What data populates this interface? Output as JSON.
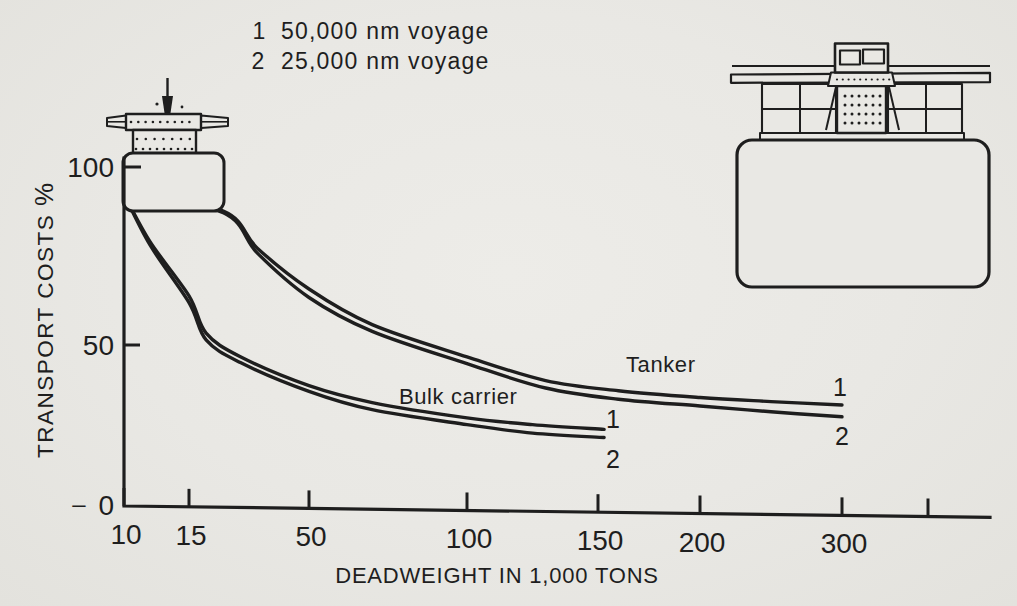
{
  "style": {
    "paper": "#e9e8e4",
    "ink": "#1e1e1e"
  },
  "legend": {
    "items": [
      {
        "marker": "1",
        "label": "50,000 nm voyage"
      },
      {
        "marker": "2",
        "label": "25,000 nm voyage"
      }
    ]
  },
  "y_axis": {
    "title": "TRANSPORT COSTS",
    "unit": "%",
    "zero_prefix": "–",
    "tick_labels": [
      "100",
      "50",
      "0"
    ]
  },
  "x_axis": {
    "title": "DEADWEIGHT IN 1,000 TONS",
    "tick_labels": [
      "10",
      "15",
      "50",
      "100",
      "150",
      "200",
      "300",
      ""
    ]
  },
  "curve_labels": {
    "tanker": "Tanker",
    "bulk": "Bulk carrier",
    "tanker_end_1": "1",
    "tanker_end_2": "2",
    "bulk_end_1": "1",
    "bulk_end_2": "2"
  },
  "illustrations": {
    "small_ship": "small-ship-illustration",
    "large_ship": "large-ship-illustration"
  },
  "chart_data": {
    "type": "line",
    "title": "",
    "xlabel": "DEADWEIGHT IN 1,000 TONS",
    "ylabel": "TRANSPORT COSTS %",
    "x_unit": "1,000 tons deadweight",
    "y_unit": "percent of reference transport cost",
    "xlim": [
      10,
      360
    ],
    "ylim": [
      0,
      110
    ],
    "x_scale_note": "hand-drawn non-linear axis; tick positions compressed toward right",
    "x_ticks": [
      10,
      15,
      50,
      100,
      150,
      200,
      300
    ],
    "y_ticks": [
      0,
      50,
      100
    ],
    "grid": false,
    "legend_entries": [
      "1  50,000 nm voyage",
      "2  25,000 nm voyage"
    ],
    "annotations": [
      "Tanker",
      "Bulk carrier"
    ],
    "series": [
      {
        "name": "Tanker - 1 (50,000 nm voyage)",
        "points": [
          [
            10,
            93
          ],
          [
            25,
            87
          ],
          [
            35,
            76
          ],
          [
            50,
            64
          ],
          [
            70,
            53.5
          ],
          [
            100,
            44
          ],
          [
            130,
            37
          ],
          [
            160,
            34
          ],
          [
            200,
            32
          ],
          [
            250,
            30.8
          ],
          [
            300,
            29.8
          ]
        ]
      },
      {
        "name": "Tanker - 2 (25,000 nm voyage)",
        "points": [
          [
            10,
            93
          ],
          [
            25,
            86.5
          ],
          [
            35,
            74.5
          ],
          [
            50,
            61.5
          ],
          [
            70,
            51.5
          ],
          [
            100,
            42
          ],
          [
            130,
            34.8
          ],
          [
            160,
            31.5
          ],
          [
            200,
            29.5
          ],
          [
            250,
            27.8
          ],
          [
            300,
            26.3
          ]
        ]
      },
      {
        "name": "Bulk carrier - 1 (50,000 nm voyage)",
        "points": [
          [
            10,
            92
          ],
          [
            12,
            78
          ],
          [
            15,
            62
          ],
          [
            20,
            51
          ],
          [
            30,
            44
          ],
          [
            50,
            35.5
          ],
          [
            70,
            30.5
          ],
          [
            100,
            26
          ],
          [
            125,
            24
          ],
          [
            153,
            22.6
          ]
        ]
      },
      {
        "name": "Bulk carrier - 2 (25,000 nm voyage)",
        "points": [
          [
            10,
            92
          ],
          [
            12,
            77
          ],
          [
            15,
            60
          ],
          [
            20,
            49
          ],
          [
            30,
            42.3
          ],
          [
            50,
            33.8
          ],
          [
            70,
            28.4
          ],
          [
            100,
            24
          ],
          [
            125,
            21.5
          ],
          [
            153,
            20.2
          ]
        ]
      }
    ]
  }
}
